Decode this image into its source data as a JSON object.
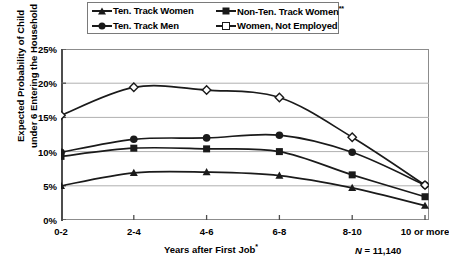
{
  "chart_data": {
    "type": "line",
    "title": "",
    "xlabel": "Years after First Job*",
    "ylabel": "Expected Probability of Child under 6 Entering the Household",
    "categories": [
      "0-2",
      "2-4",
      "4-6",
      "6-8",
      "8-10",
      "10 or more"
    ],
    "ylim": [
      0,
      25
    ],
    "ytick_labels": [
      "0%",
      "5%",
      "10%",
      "15%",
      "20%",
      "25%"
    ],
    "ytick_values": [
      0,
      5,
      10,
      15,
      20,
      25
    ],
    "grid": "horizontal",
    "legend_position": "top",
    "note": "N = 11,140",
    "note_prefix": "N",
    "note_value": " = 11,140",
    "series": [
      {
        "name": "Ten. Track Women",
        "marker": "triangle-icon",
        "color": "#1a1a1a",
        "values": [
          5.0,
          6.9,
          7.0,
          6.5,
          4.7,
          2.1
        ]
      },
      {
        "name": "Ten. Track Men",
        "marker": "circle-icon",
        "color": "#1a1a1a",
        "values": [
          9.9,
          11.8,
          12.0,
          12.4,
          9.9,
          5.1
        ]
      },
      {
        "name": "Non-Ten. Track Women",
        "name_suffix": "**",
        "marker": "square-icon",
        "color": "#1a1a1a",
        "values": [
          9.3,
          10.5,
          10.4,
          10.0,
          6.6,
          3.4
        ]
      },
      {
        "name": "Women, Not Employed",
        "marker": "open-diamond-icon",
        "color": "#1a1a1a",
        "values": [
          15.3,
          19.4,
          19.0,
          17.9,
          12.1,
          5.1
        ]
      }
    ]
  },
  "legend": {
    "entries": [
      {
        "label": "Ten. Track Women",
        "suffix": ""
      },
      {
        "label": "Non-Ten. Track Women",
        "suffix": "**"
      },
      {
        "label": "Ten. Track Men",
        "suffix": ""
      },
      {
        "label": "Women, Not Employed",
        "suffix": ""
      }
    ]
  },
  "axes": {
    "x_title_text": "Years after First Job",
    "x_title_suffix": "*",
    "y_title_line1": "Expected Probability of Child",
    "y_title_line2": "under 6 Entering the Household"
  }
}
